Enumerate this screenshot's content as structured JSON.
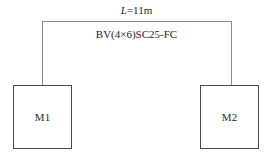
{
  "diagram": {
    "type": "electrical-wiring-riser",
    "annotations": {
      "length_symbol": "L",
      "length_value": "=11m",
      "cable_spec": "BV(4×6)SC25-FC"
    },
    "nodes": [
      {
        "id": "M1",
        "label": "M1"
      },
      {
        "id": "M2",
        "label": "M2"
      }
    ],
    "colors": {
      "background": "#ffffff",
      "cable_line": "#8a8a8a",
      "box_border": "#4a4a4a",
      "text": "#1c1c1c"
    }
  }
}
